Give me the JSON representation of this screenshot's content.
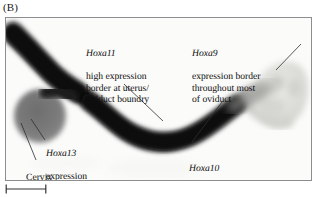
{
  "figure": {
    "panel_label": "(B)",
    "description_alt": "Whole-mount in situ hybridization of a mouse female reproductive tract showing Hox gene expression domains"
  },
  "annotations": [
    {
      "id": "hoxa11",
      "gene": "Hoxa11",
      "text": "high expression\nborder at uterus/\noviduct boundry",
      "leader": {
        "x1": 118,
        "y1": 66,
        "x2": 157,
        "y2": 103
      }
    },
    {
      "id": "hoxa9",
      "gene": "Hoxa9",
      "text": "expression border\nthroughout most\nof oviduct",
      "leader": {
        "x1": 295,
        "y1": 26,
        "x2": 270,
        "y2": 52
      }
    },
    {
      "id": "hoxa13",
      "gene": "Hoxa13",
      "text": "expression",
      "leader": {
        "x1": 39,
        "y1": 122,
        "x2": 25,
        "y2": 101
      }
    },
    {
      "id": "cervix",
      "gene": "",
      "text": "Cervix",
      "leader": {
        "x1": 30,
        "y1": 142,
        "x2": 15,
        "y2": 105
      }
    },
    {
      "id": "hoxa10",
      "gene": "Hoxa10",
      "text": "expression border\nat uterus/oviduct boundary",
      "leader": {
        "x1": 186,
        "y1": 124,
        "x2": 216,
        "y2": 84
      }
    }
  ],
  "scale_bar": {
    "label": "",
    "length_px": 42
  },
  "colors": {
    "stain_dark": "#111111",
    "stain_mid": "#5b5b5b",
    "cervix_gray": "#7d7d7d",
    "oviduct_pale": "#d9d9d6",
    "background": "#fbfbfa",
    "frame_border": "#8e8e8e",
    "text": "#0d0d0d",
    "leader_line": "#3a3a3a"
  }
}
